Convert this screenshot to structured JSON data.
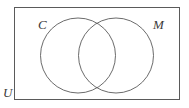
{
  "figure": {
    "type": "venn-diagram",
    "background_color": "#ffffff",
    "stroke_color": "#5a5a5a",
    "label_color": "#3b3b3b"
  },
  "universe": {
    "label": "U",
    "shape": "rectangle",
    "x": 14,
    "y": 7,
    "width": 166,
    "height": 93
  },
  "sets": [
    {
      "label": "C",
      "shape": "circle",
      "cx": 78,
      "cy": 55.5,
      "r": 37.5
    },
    {
      "label": "M",
      "shape": "circle",
      "cx": 116,
      "cy": 55.5,
      "r": 37.5
    }
  ]
}
